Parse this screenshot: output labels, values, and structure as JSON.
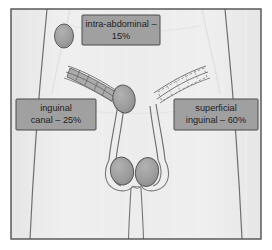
{
  "figure": {
    "frame": {
      "border_color": "#4f4f4f",
      "page_background": "#ffffff"
    },
    "body": {
      "fill_color": "#ececec",
      "outline_color": "#6f6f6f",
      "description": "male lower torso silhouette, front view"
    },
    "anatomy": {
      "testis_fill": "#9d9d9d",
      "testis_outline": "#5a5a5a",
      "canal_fill": "#a8a8a8",
      "duct_color": "#6b6b6b",
      "left_side_style": "shaded",
      "right_side_style": "dashed-outline"
    },
    "labels": [
      {
        "id": "intra-abdominal",
        "line1": "intra-abdominal –",
        "line2": "15%",
        "percent": "15%",
        "box_fill": "#a0a0a0",
        "box_stroke": "#4a4a4a"
      },
      {
        "id": "inguinal-canal",
        "line1": "inguinal",
        "line2": "canal – 25%",
        "percent": "25%",
        "box_fill": "#a0a0a0",
        "box_stroke": "#4a4a4a"
      },
      {
        "id": "superficial-inguinal",
        "line1": "superficial",
        "line2": "inguinal – 60%",
        "percent": "60%",
        "box_fill": "#a0a0a0",
        "box_stroke": "#4a4a4a"
      }
    ],
    "markers": {
      "intra_abdominal_testis": "isolated oval at upper left"
    }
  }
}
